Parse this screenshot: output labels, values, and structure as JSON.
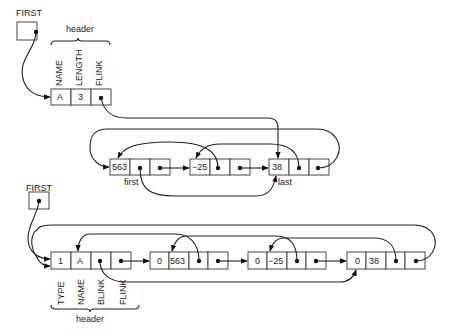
{
  "diagram_1": {
    "first_label": "FIRST",
    "header_brace_label": "header",
    "field_labels": [
      "NAME",
      "LENGTH",
      "FLINK"
    ],
    "header_cells": [
      "A",
      "3",
      ""
    ],
    "nodes": [
      {
        "value": "563",
        "tag": "first"
      },
      {
        "value": "−25",
        "tag": ""
      },
      {
        "value": "38",
        "tag": "last"
      }
    ]
  },
  "diagram_2": {
    "first_label": "FIRST",
    "header_brace_label": "header",
    "field_labels": [
      "TYPE",
      "NAME",
      "BLINK",
      "FLINK"
    ],
    "header_cells": [
      "1",
      "A",
      "",
      ""
    ],
    "nodes": [
      {
        "type": "0",
        "value": "563"
      },
      {
        "type": "0",
        "value": "−25"
      },
      {
        "type": "0",
        "value": "38"
      }
    ]
  },
  "colors": {
    "line": "#222222",
    "background": "#ffffff"
  }
}
